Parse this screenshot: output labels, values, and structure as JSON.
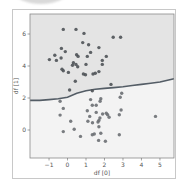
{
  "chart_data": {
    "type": "scatter",
    "title": "",
    "xlabel": "df [0]",
    "ylabel": "df [1]",
    "xlim": [
      -2.03,
      5.76
    ],
    "ylim": [
      -1.75,
      7.25
    ],
    "xticks": [
      -1,
      0,
      1,
      2,
      3,
      4,
      5
    ],
    "yticks": [
      0,
      2,
      4,
      6
    ],
    "grid": false,
    "legend": null,
    "regions": {
      "upper_color": "#e4e4e4",
      "lower_color": "#f3f3f3"
    },
    "decision_boundary": {
      "color": "#545d66",
      "points": [
        [
          -2.03,
          1.85
        ],
        [
          -1.5,
          1.85
        ],
        [
          -1.0,
          1.9
        ],
        [
          -0.5,
          1.95
        ],
        [
          0.0,
          2.05
        ],
        [
          0.5,
          2.3
        ],
        [
          1.0,
          2.45
        ],
        [
          1.5,
          2.55
        ],
        [
          2.0,
          2.6
        ],
        [
          2.5,
          2.65
        ],
        [
          3.0,
          2.7
        ],
        [
          3.5,
          2.78
        ],
        [
          4.0,
          2.85
        ],
        [
          4.5,
          2.92
        ],
        [
          5.0,
          3.0
        ],
        [
          5.76,
          3.2
        ]
      ]
    },
    "series": [
      {
        "name": "class_upper",
        "color": "#4e5257",
        "points": [
          [
            -0.23,
            6.29
          ],
          [
            0.46,
            6.29
          ],
          [
            0.89,
            6.04
          ],
          [
            0.82,
            5.46
          ],
          [
            1.14,
            5.33
          ],
          [
            1.7,
            5.15
          ],
          [
            2.47,
            5.8
          ],
          [
            2.87,
            5.8
          ],
          [
            -0.33,
            5.1
          ],
          [
            -0.12,
            4.9
          ],
          [
            1.25,
            4.85
          ],
          [
            0.49,
            4.7
          ],
          [
            0.57,
            4.6
          ],
          [
            1.07,
            4.6
          ],
          [
            -0.69,
            4.67
          ],
          [
            -0.98,
            4.4
          ],
          [
            -0.6,
            4.35
          ],
          [
            -0.35,
            4.5
          ],
          [
            2.1,
            4.6
          ],
          [
            1.88,
            4.35
          ],
          [
            1.88,
            4.1
          ],
          [
            0.32,
            4.2
          ],
          [
            0.46,
            4.1
          ],
          [
            0.27,
            4.05
          ],
          [
            0.55,
            3.95
          ],
          [
            1.0,
            4.1
          ],
          [
            -0.23,
            3.7
          ],
          [
            -0.3,
            3.8
          ],
          [
            0.05,
            3.6
          ],
          [
            0.86,
            3.5
          ],
          [
            0.97,
            3.45
          ],
          [
            1.38,
            3.5
          ],
          [
            1.5,
            3.55
          ],
          [
            1.7,
            3.65
          ],
          [
            0.42,
            3.05
          ],
          [
            0.11,
            2.5
          ],
          [
            1.34,
            2.45
          ],
          [
            2.35,
            2.85
          ]
        ]
      },
      {
        "name": "class_lower",
        "color": "#6c6f73",
        "points": [
          [
            -0.4,
            1.8
          ],
          [
            -0.23,
            1.35
          ],
          [
            -0.4,
            0.93
          ],
          [
            1.25,
            1.9
          ],
          [
            1.8,
            1.95
          ],
          [
            1.76,
            1.8
          ],
          [
            2.93,
            2.3
          ],
          [
            2.85,
            2.05
          ],
          [
            1.34,
            1.55
          ],
          [
            1.55,
            1.55
          ],
          [
            2.9,
            1.25
          ],
          [
            1.07,
            1.2
          ],
          [
            1.55,
            1.1
          ],
          [
            1.9,
            1.0
          ],
          [
            2.1,
            1.05
          ],
          [
            2.17,
            0.95
          ],
          [
            2.25,
            0.8
          ],
          [
            2.8,
            0.95
          ],
          [
            1.2,
            0.85
          ],
          [
            1.75,
            0.75
          ],
          [
            1.7,
            0.6
          ],
          [
            1.65,
            0.5
          ],
          [
            1.1,
            0.55
          ],
          [
            1.35,
            0.45
          ],
          [
            0.17,
            0.55
          ],
          [
            4.76,
            0.85
          ],
          [
            0.36,
            0.05
          ],
          [
            1.7,
            0.2
          ],
          [
            -0.23,
            -0.1
          ],
          [
            0.7,
            -0.4
          ],
          [
            1.34,
            -0.3
          ],
          [
            1.45,
            -0.25
          ],
          [
            1.8,
            -0.2
          ],
          [
            2.8,
            -0.3
          ],
          [
            1.68,
            -0.65
          ],
          [
            2.05,
            -0.7
          ]
        ]
      }
    ]
  }
}
